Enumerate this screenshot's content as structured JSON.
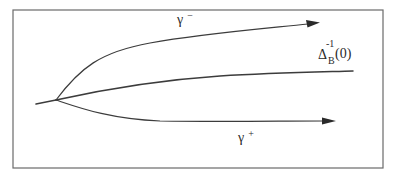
{
  "diagram": {
    "type": "branching-curves",
    "frame": {
      "stroke": "#6a6a6a"
    },
    "branch_point": {
      "x": 56,
      "y": 100
    },
    "curves": [
      {
        "id": "gamma-minus",
        "label_base": "γ",
        "label_sup": "−",
        "has_arrow": true
      },
      {
        "id": "delta-inverse",
        "label_base": "Δ",
        "label_sup": "-1",
        "label_sub": "B",
        "label_arg": "(0)",
        "has_arrow": false
      },
      {
        "id": "gamma-plus",
        "label_base": "γ",
        "label_sup": "+",
        "has_arrow": true
      }
    ],
    "colors": {
      "line": "#3c3c3c",
      "text": "#2a2a2a",
      "background": "#ffffff"
    }
  }
}
